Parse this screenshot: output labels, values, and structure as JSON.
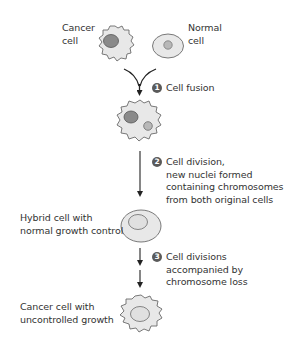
{
  "figure": {
    "colors": {
      "cell_fill": "#e8e8e8",
      "cell_outline": "#6b6b6b",
      "cancer_nucleus": "#8a8a8a",
      "normal_nucleus": "#b8b8b8",
      "arrow": "#222222",
      "badge": "#5a5a5a"
    },
    "cells": {
      "cancer": {
        "label_lines": [
          "Cancer",
          "cell"
        ]
      },
      "normal": {
        "label_lines": [
          "Normal",
          "cell"
        ]
      },
      "fused": {
        "label_lines": []
      },
      "hybrid": {
        "label_lines": [
          "Hybrid cell with",
          "normal growth control"
        ]
      },
      "cancer_final": {
        "label_lines": [
          "Cancer cell with",
          "uncontrolled growth"
        ]
      }
    },
    "steps": [
      {
        "number": "1",
        "lines": [
          "Cell fusion"
        ]
      },
      {
        "number": "2",
        "lines": [
          "Cell division,",
          "new nuclei formed",
          "containing chromosomes",
          "from both original cells"
        ]
      },
      {
        "number": "3",
        "lines": [
          "Cell divisions",
          "accompanied by",
          "chromosome loss"
        ]
      }
    ]
  }
}
